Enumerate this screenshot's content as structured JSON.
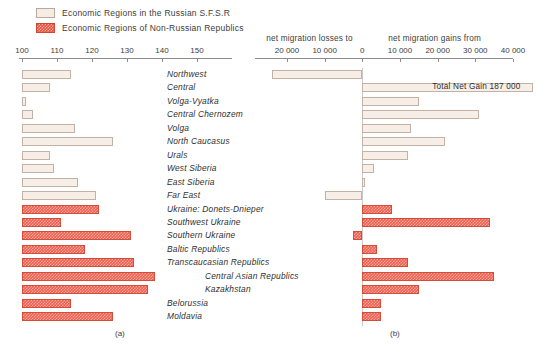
{
  "legend": {
    "items": [
      {
        "label": "Economic Regions in the Russian S.F.S.R",
        "swatch": "light",
        "color": "#f6ece4"
      },
      {
        "label": "Economic Regions of Non-Russian Republics",
        "swatch": "red",
        "color": "#e8523f"
      }
    ]
  },
  "panels": {
    "left_label": "(a)",
    "right_label": "(b)"
  },
  "annotations": {
    "total_net_gain": "Total Net Gain 187 000"
  },
  "chart_data": [
    {
      "type": "bar",
      "id": "panel-a",
      "orientation": "horizontal",
      "title": "(a)",
      "xlabel": "",
      "ylabel": "",
      "xlim": [
        100,
        155
      ],
      "ticks": [
        100,
        110,
        120,
        130,
        140,
        150
      ],
      "tick_labels": [
        "100",
        "110",
        "120",
        "130",
        "140",
        "150"
      ],
      "grid": false,
      "categories": [
        "Northwest",
        "Central",
        "Volga-Vyatka",
        "Central Chernozem",
        "Volga",
        "North Caucasus",
        "Urals",
        "West Siberia",
        "East Siberia",
        "Far East",
        "Ukraine: Donets-Dnieper",
        "Southwest Ukraine",
        "Southern Ukraine",
        "Baltic Republics",
        "Transcaucasian Republics",
        "Central Asian Republics",
        "Kazakhstan",
        "Belorussia",
        "Moldavia"
      ],
      "values": [
        114,
        108,
        101,
        103,
        115,
        126,
        108,
        109,
        116,
        121,
        122,
        111,
        131,
        118,
        132,
        138,
        136,
        114,
        126
      ]
    },
    {
      "type": "bar",
      "id": "panel-b",
      "orientation": "horizontal",
      "title": "(b)",
      "xlabel_left": "net migration losses to",
      "xlabel_right": "net migration gains from",
      "xlim": [
        -30000,
        40000
      ],
      "ticks": [
        -30000,
        -20000,
        -10000,
        0,
        10000,
        20000,
        30000,
        40000
      ],
      "tick_labels": [
        "30 000",
        "20 000",
        "10 000",
        "0",
        "10 000",
        "20 000",
        "30 000",
        "40 000"
      ],
      "grid": false,
      "categories": [
        "Northwest",
        "Central",
        "Volga-Vyatka",
        "Central Chernozem",
        "Volga",
        "North Caucasus",
        "Urals",
        "West Siberia",
        "East Siberia",
        "Far East",
        "Ukraine: Donets-Dnieper",
        "Southwest Ukraine",
        "Southern Ukraine",
        "Baltic Republics",
        "Transcaucasian Republics",
        "Central Asian Republics",
        "Kazakhstan",
        "Belorussia",
        "Moldavia"
      ],
      "values": [
        -24000,
        50000,
        15000,
        31000,
        13000,
        22000,
        12000,
        3000,
        800,
        -10000,
        8000,
        34000,
        -2500,
        4000,
        12000,
        35000,
        15000,
        5000,
        5000
      ]
    }
  ]
}
